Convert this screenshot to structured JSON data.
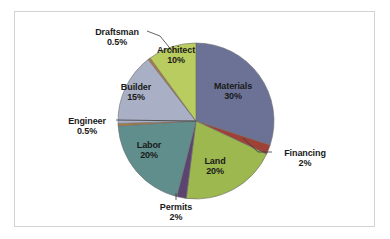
{
  "chart_data": {
    "type": "pie",
    "title": "",
    "subtitle": "",
    "xlabel": "",
    "ylabel": "",
    "legend_position": "none",
    "grid": false,
    "labels_show_percent": true,
    "total_percent": 100,
    "categories": [
      "Materials",
      "Financing",
      "Land",
      "Permits",
      "Labor",
      "Engineer",
      "Builder",
      "Draftsman",
      "Architect"
    ],
    "values": [
      30,
      2,
      20,
      2,
      20,
      0.5,
      15,
      0.5,
      10
    ],
    "slices": [
      {
        "label": "Materials",
        "percent_text": "30%",
        "value": 30,
        "color": "#6b7296",
        "label_placement": "inside",
        "leader_line": false,
        "start_angle_deg": 0,
        "end_angle_deg": 108
      },
      {
        "label": "Financing",
        "percent_text": "2%",
        "value": 2,
        "color": "#9e4238",
        "label_placement": "outside",
        "leader_line": true,
        "start_angle_deg": 108,
        "end_angle_deg": 115.2
      },
      {
        "label": "Land",
        "percent_text": "20%",
        "value": 20,
        "color": "#9cb84f",
        "label_placement": "inside",
        "leader_line": false,
        "start_angle_deg": 115.2,
        "end_angle_deg": 187.2
      },
      {
        "label": "Permits",
        "percent_text": "2%",
        "value": 2,
        "color": "#5c4470",
        "label_placement": "outside",
        "leader_line": true,
        "start_angle_deg": 187.2,
        "end_angle_deg": 194.4
      },
      {
        "label": "Labor",
        "percent_text": "20%",
        "value": 20,
        "color": "#5f8e8c",
        "label_placement": "inside",
        "leader_line": false,
        "start_angle_deg": 194.4,
        "end_angle_deg": 266.4
      },
      {
        "label": "Engineer",
        "percent_text": "0.5%",
        "value": 0.5,
        "color": "#b07a3c",
        "label_placement": "outside",
        "leader_line": true,
        "start_angle_deg": 266.4,
        "end_angle_deg": 268.2
      },
      {
        "label": "Builder",
        "percent_text": "15%",
        "value": 15,
        "color": "#a9afc4",
        "label_placement": "inside",
        "leader_line": false,
        "start_angle_deg": 268.2,
        "end_angle_deg": 322.2
      },
      {
        "label": "Draftsman",
        "percent_text": "0.5%",
        "value": 0.5,
        "color": "#b07a3c",
        "label_placement": "outside",
        "leader_line": true,
        "start_angle_deg": 322.2,
        "end_angle_deg": 324
      },
      {
        "label": "Architect",
        "percent_text": "10%",
        "value": 10,
        "color": "#b9cc5f",
        "label_placement": "inside",
        "leader_line": false,
        "start_angle_deg": 324,
        "end_angle_deg": 360
      }
    ],
    "geometry": {
      "center_x": 196,
      "center_y": 121,
      "radius": 78
    },
    "style": {
      "background": "#ffffff",
      "frame_color": "#d2d2d2",
      "slice_border_color": "#6d6d6d",
      "label_text_color": "#1a1a1a"
    }
  },
  "labels": {
    "materials": {
      "name": "Materials",
      "pct": "30%",
      "x": 203,
      "y": 81,
      "w": 60
    },
    "architect": {
      "name": "Architect",
      "pct": "10%",
      "x": 148,
      "y": 45,
      "w": 56
    },
    "builder": {
      "name": "Builder",
      "pct": "15%",
      "x": 110,
      "y": 82,
      "w": 52
    },
    "labor": {
      "name": "Labor",
      "pct": "20%",
      "x": 125,
      "y": 140,
      "w": 48
    },
    "land": {
      "name": "Land",
      "pct": "20%",
      "x": 192,
      "y": 156,
      "w": 46
    },
    "draftsman": {
      "name": "Draftsman",
      "pct": "0.5%",
      "x": 86,
      "y": 27,
      "w": 62
    },
    "engineer": {
      "name": "Engineer",
      "pct": "0.5%",
      "x": 58,
      "y": 116,
      "w": 58
    },
    "financing": {
      "name": "Financing",
      "pct": "2%",
      "x": 274,
      "y": 148,
      "w": 62
    },
    "permits": {
      "name": "Permits",
      "pct": "2%",
      "x": 150,
      "y": 202,
      "w": 52
    }
  }
}
